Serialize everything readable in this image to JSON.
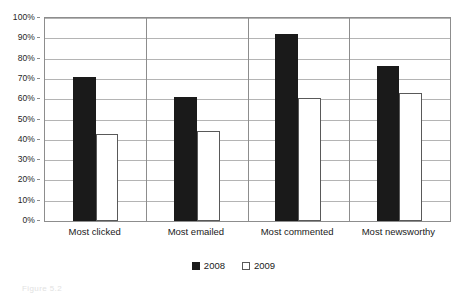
{
  "chart_data": {
    "type": "bar",
    "title": "",
    "subtitle": "",
    "xlabel": "",
    "ylabel": "",
    "categories": [
      "Most clicked",
      "Most emailed",
      "Most commented",
      "Most newsworthy"
    ],
    "series": [
      {
        "name": "2008",
        "color": "#1a1a1a",
        "values": [
          71,
          61,
          92,
          76.5
        ]
      },
      {
        "name": "2009",
        "color": "#ffffff",
        "values": [
          43,
          44.5,
          60.5,
          63
        ]
      }
    ],
    "ylim": [
      0,
      100
    ],
    "ytick_step": 10,
    "ytick_labels": [
      "0%",
      "10%",
      "20%",
      "30%",
      "40%",
      "50%",
      "60%",
      "70%",
      "80%",
      "90%",
      "100%"
    ],
    "ytick_values": [
      0,
      10,
      20,
      30,
      40,
      50,
      60,
      70,
      80,
      90,
      100
    ],
    "value_format": "percent",
    "grid": true,
    "grid_axis": "y",
    "category_separators": true,
    "legend": {
      "position": "bottom",
      "entries": [
        "2008",
        "2009"
      ]
    }
  },
  "colors": {
    "plot_background": "#ffffff",
    "frame": "#8d8d8d",
    "gridline": "#b4b4b4",
    "bar_2008_fill": "#1a1a1a",
    "bar_2009_fill": "#ffffff",
    "bar_2009_border": "#595959",
    "text": "#1a1a1a"
  },
  "caption_remnant": "Figure 5.2"
}
